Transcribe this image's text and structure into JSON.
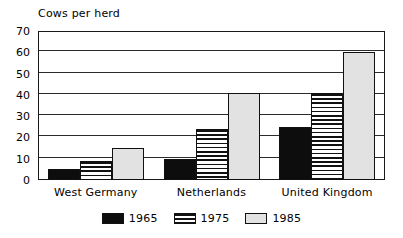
{
  "chart_data": {
    "type": "bar",
    "title": "Cows per herd",
    "xlabel": "",
    "ylabel": "",
    "ylim": [
      0,
      70
    ],
    "yticks": [
      0,
      10,
      20,
      30,
      40,
      50,
      60,
      70
    ],
    "grid": true,
    "legend_position": "bottom",
    "categories": [
      "West Germany",
      "Netherlands",
      "United Kingdom"
    ],
    "series": [
      {
        "name": "1965",
        "values": [
          5,
          10,
          25
        ],
        "fill": "solid-black",
        "color": "#0d0d0d"
      },
      {
        "name": "1975",
        "values": [
          9,
          24,
          41
        ],
        "fill": "horizontal-stripes",
        "color": "#f2f2f2"
      },
      {
        "name": "1985",
        "values": [
          15,
          41,
          60
        ],
        "fill": "light-gray",
        "color": "#e2e2e2"
      }
    ]
  },
  "legend": {
    "items": [
      {
        "label": "1965"
      },
      {
        "label": "1975"
      },
      {
        "label": "1985"
      }
    ]
  }
}
